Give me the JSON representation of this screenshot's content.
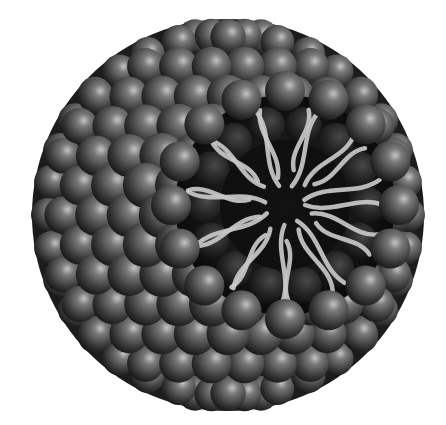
{
  "image": {
    "subject": "micelle illustration",
    "description": "Spherical cluster of dark grey shaded spheres (hydrophilic heads) with a cutaway revealing light grey wavy tails (hydrophobic chains) pointing inward to the core",
    "colors": {
      "background": "#ffffff",
      "sphere_highlight": "#bdbdbd",
      "sphere_mid": "#5a5a5a",
      "sphere_shadow": "#1a1a1a",
      "core": "#111111",
      "tail": "#c8c8c8"
    },
    "center": [
      228,
      215
    ],
    "radius": 196,
    "cutaway_center": [
      285,
      205
    ],
    "cutaway_radius": 110
  }
}
